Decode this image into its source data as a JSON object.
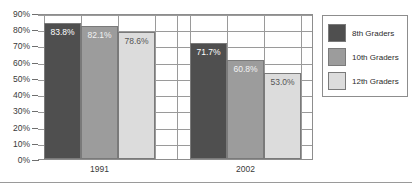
{
  "chart_data": {
    "type": "bar",
    "title": "",
    "xlabel": "",
    "ylabel": "",
    "ylim": [
      0,
      90
    ],
    "grid": true,
    "legend_position": "right",
    "categories": [
      "1991",
      "2002"
    ],
    "tick_labels": [
      "0%",
      "10%",
      "20%",
      "30%",
      "40%",
      "50%",
      "60%",
      "70%",
      "80%",
      "90%"
    ],
    "tick_values": [
      0,
      10,
      20,
      30,
      40,
      50,
      60,
      70,
      80,
      90
    ],
    "series": [
      {
        "name": "8th Graders",
        "color": "#4f4f4f",
        "label_color": "#ffffff",
        "values": [
          83.8,
          60.8
        ],
        "data_labels": [
          "83.8%",
          "71.7%"
        ]
      },
      {
        "name": "10th Graders",
        "color": "#9c9c9c",
        "label_color": "#f2f2f2",
        "values": [
          82.1,
          60.8
        ],
        "data_labels": [
          "82.1%",
          "60.8%"
        ]
      },
      {
        "name": "12th Graders",
        "color": "#dcdcdc",
        "label_color": "#555555",
        "values": [
          78.6,
          53.0
        ],
        "data_labels": [
          "78.6%",
          "53.0%"
        ]
      }
    ],
    "points": [
      {
        "category": "1991",
        "series": "8th Graders",
        "value": 83.8,
        "label": "83.8%"
      },
      {
        "category": "1991",
        "series": "10th Graders",
        "value": 82.1,
        "label": "82.1%"
      },
      {
        "category": "1991",
        "series": "12th Graders",
        "value": 78.6,
        "label": "78.6%"
      },
      {
        "category": "2002",
        "series": "8th Graders",
        "value": 71.7,
        "label": "71.7%"
      },
      {
        "category": "2002",
        "series": "10th Graders",
        "value": 60.8,
        "label": "60.8%"
      },
      {
        "category": "2002",
        "series": "12th Graders",
        "value": 53.0,
        "label": "53.0%"
      }
    ]
  },
  "legend": {
    "entries": [
      {
        "label": "8th Graders",
        "color": "#4f4f4f"
      },
      {
        "label": "10th Graders",
        "color": "#9c9c9c"
      },
      {
        "label": "12th Graders",
        "color": "#dcdcdc"
      }
    ]
  },
  "axis": {
    "y_ticks": [
      "90%",
      "80%",
      "70%",
      "60%",
      "50%",
      "40%",
      "30%",
      "20%",
      "10%",
      "0%"
    ]
  },
  "colors": {
    "grid": "#9a9a9a",
    "axis": "#6f6f6f",
    "border": "#8d8d8d",
    "text": "#3a3a3a",
    "background": "#ffffff"
  }
}
